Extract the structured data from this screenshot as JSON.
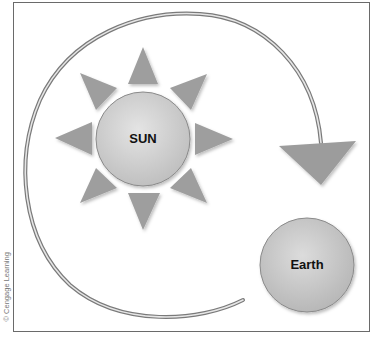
{
  "diagram": {
    "type": "orbit-illustration",
    "sun": {
      "label": "SUN",
      "center": [
        143,
        139
      ],
      "radius": 47,
      "fill": "#d0d0d0",
      "ray_count": 8,
      "ray_color": "#9a9a9a"
    },
    "earth": {
      "label": "Earth",
      "center": [
        307,
        265
      ],
      "radius": 47,
      "fill": "#c8c8c8"
    },
    "orbit_arrow": {
      "description": "curved arrow sweeping counter-clockwise around the sun from near Earth to an arrowhead above Earth",
      "line_color": "#8c8c8c",
      "arrowhead_color": "#9a9a9a"
    },
    "credit": "© Cengage Learning"
  },
  "colors": {
    "frame_border": "#6a6a6a",
    "background": "#ffffff",
    "text": "#111111"
  }
}
